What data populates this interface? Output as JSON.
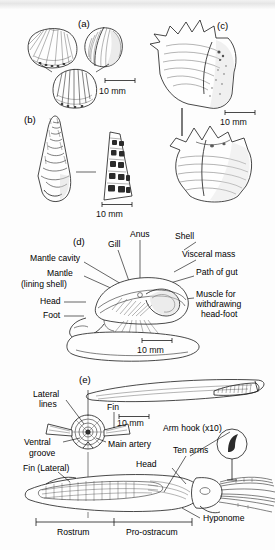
{
  "figure": {
    "background": "#fdfdfd",
    "ink": "#1a1a1a"
  },
  "panels": [
    {
      "id": "a",
      "label": "(a)",
      "subject": "brachiopod-shell-three-views",
      "scale": {
        "text": "10 mm"
      }
    },
    {
      "id": "b",
      "label": "(b)",
      "subject": "turreted-gastropod-with-section",
      "scale": {
        "text": "10 mm"
      }
    },
    {
      "id": "c",
      "label": "(c)",
      "subject": "spinose-gastropod-two-views",
      "scale": {
        "text": "10 mm"
      }
    },
    {
      "id": "d",
      "label": "(d)",
      "subject": "gastropod-soft-anatomy",
      "scale": {
        "text": "10 mm"
      },
      "annotations": [
        "Anus",
        "Shell",
        "Gill",
        "Visceral mass",
        "Mantle cavity",
        "Path of gut",
        "Mantle",
        "(lining shell)",
        "Muscle for",
        "withdrawing",
        "head-foot",
        "Head",
        "Foot"
      ]
    },
    {
      "id": "e",
      "label": "(e)",
      "subject": "belemnite-guard-and-reconstruction",
      "scale": {
        "text": "10 mm"
      },
      "annotations": [
        "Lateral",
        "lines",
        "Fin",
        "Ventral",
        "groove",
        "Main artery",
        "Fin (Lateral)",
        "Arm hook (x10)",
        "Ten arms",
        "Head",
        "Hyponome",
        "Rostrum",
        "Pro-ostracum"
      ]
    }
  ],
  "labels": {
    "panel_a": "(a)",
    "panel_b": "(b)",
    "panel_c": "(c)",
    "panel_d": "(d)",
    "panel_e": "(e)",
    "scale_a": "10 mm",
    "scale_b": "10 mm",
    "scale_c": "10 mm",
    "scale_d": "10 mm",
    "scale_e": "10 mm",
    "d_anus": "Anus",
    "d_shell": "Shell",
    "d_gill": "Gill",
    "d_visceral_mass": "Visceral mass",
    "d_mantle_cavity": "Mantle cavity",
    "d_path_of_gut": "Path of gut",
    "d_mantle": "Mantle",
    "d_lining_shell": "(lining shell)",
    "d_muscle1": "Muscle for",
    "d_muscle2": "withdrawing",
    "d_muscle3": "head-foot",
    "d_head": "Head",
    "d_foot": "Foot",
    "e_lateral": "Lateral",
    "e_lines": "lines",
    "e_fin": "Fin",
    "e_ventral": "Ventral",
    "e_groove": "groove",
    "e_main_artery": "Main artery",
    "e_fin_lateral": "Fin (Lateral)",
    "e_arm_hook": "Arm hook (x10)",
    "e_ten_arms": "Ten arms",
    "e_head": "Head",
    "e_hyponome": "Hyponome",
    "e_rostrum": "Rostrum",
    "e_pro_ostracum": "Pro-ostracum"
  }
}
